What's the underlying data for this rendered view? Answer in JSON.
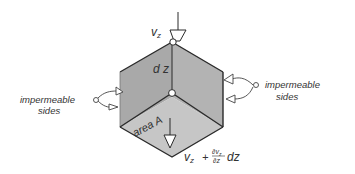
{
  "diagram": {
    "top_flux_label": "v",
    "top_flux_sub": "z",
    "height_label": "d z",
    "area_label": "area A",
    "left_sides_label_line1": "impermeable",
    "left_sides_label_line2": "sides",
    "right_sides_label_line1": "impermeable",
    "right_sides_label_line2": "sides",
    "bottom_flux": {
      "v": "v",
      "sub": "z",
      "plus": "+",
      "num": "∂v",
      "num_sub": "z",
      "den": "∂z",
      "tail": "dz"
    }
  },
  "colors": {
    "left_face": "#a9a9a9",
    "right_face": "#b3b3b3",
    "bottom_face": "#c4c4c4",
    "edge": "#2a2a2a",
    "text": "#333333"
  }
}
